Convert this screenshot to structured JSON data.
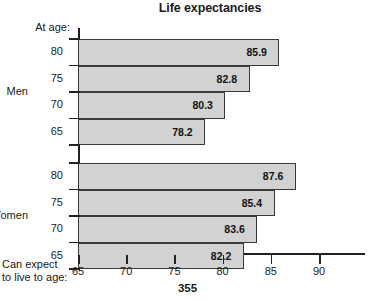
{
  "chart_data": {
    "type": "bar",
    "orientation": "horizontal",
    "title": "Life expectancies",
    "xlabel": "Can expect to live to age:",
    "ylabel": "At age:",
    "xlim": [
      65,
      90
    ],
    "xticks": [
      65,
      70,
      75,
      80,
      85,
      90
    ],
    "xtick_labels": [
      "65",
      "70",
      "75",
      "80",
      "85",
      "90"
    ],
    "grid": false,
    "legend": null,
    "categories": [
      "80",
      "75",
      "70",
      "65"
    ],
    "groups": [
      {
        "name": "Men",
        "bars": [
          {
            "category": "80",
            "value": 85.9,
            "label": "85.9"
          },
          {
            "category": "75",
            "value": 82.8,
            "label": "82.8"
          },
          {
            "category": "70",
            "value": 80.3,
            "label": "80.3"
          },
          {
            "category": "65",
            "value": 78.2,
            "label": "78.2"
          }
        ]
      },
      {
        "name": "Women",
        "bars": [
          {
            "category": "80",
            "value": 87.6,
            "label": "87.6"
          },
          {
            "category": "75",
            "value": 85.4,
            "label": "85.4"
          },
          {
            "category": "70",
            "value": 83.6,
            "label": "83.6"
          },
          {
            "category": "65",
            "value": 82.2,
            "label": "82.2"
          }
        ]
      }
    ],
    "series": [
      {
        "name": "Men",
        "values": [
          85.9,
          82.8,
          80.3,
          78.2
        ]
      },
      {
        "name": "Women",
        "values": [
          87.6,
          85.4,
          83.6,
          82.2
        ]
      }
    ],
    "colors": {
      "bar_fill": "#d2d2d2",
      "bar_border": "#3a3a3a",
      "axis": "#222222",
      "text": "#1a1a1a"
    }
  },
  "axis_caption": {
    "line1": "Can expect",
    "line2": "to live to age:"
  },
  "footer": {
    "page_number": "355"
  }
}
